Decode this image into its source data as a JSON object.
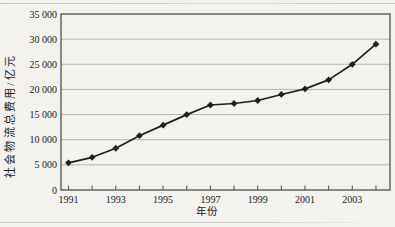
{
  "figure": {
    "background_color": "#f3f2ee",
    "ink_color": "#21211c",
    "grid_color": "#9b9a93",
    "axis_color": "#45443e"
  },
  "chart_data": {
    "type": "line",
    "title": "",
    "xlabel": "年份",
    "ylabel": "社会物流总费用/亿元",
    "x": [
      1991,
      1992,
      1993,
      1994,
      1995,
      1996,
      1997,
      1998,
      1999,
      2000,
      2001,
      2002,
      2003,
      2004
    ],
    "values": [
      5400,
      6500,
      8300,
      10800,
      12900,
      15000,
      16900,
      17200,
      17800,
      19000,
      20100,
      21900,
      25000,
      29000
    ],
    "ylim": [
      0,
      35000
    ],
    "ytick_values": [
      0,
      5000,
      10000,
      15000,
      20000,
      25000,
      30000,
      35000
    ],
    "ytick_labels": [
      "0",
      "5 000",
      "10 000",
      "15 000",
      "20 000",
      "25 000",
      "30 000",
      "35 000"
    ],
    "xtick_minor_years": [
      1991,
      1992,
      1993,
      1994,
      1995,
      1996,
      1997,
      1998,
      1999,
      2000,
      2001,
      2002,
      2003,
      2004
    ],
    "xtick_label_years": [
      "1991",
      "1993",
      "1995",
      "1997",
      "1999",
      "2001",
      "2003"
    ],
    "grid": true,
    "legend": "none",
    "marker": "diamond",
    "line_color": "#21211c",
    "marker_color": "#21211c"
  }
}
